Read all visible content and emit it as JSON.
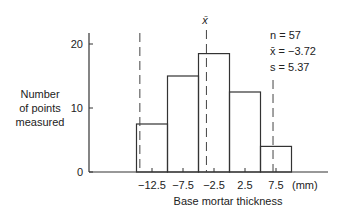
{
  "chart_data": {
    "type": "bar",
    "title": "",
    "xlabel": "Base mortar thickness",
    "x_unit": "(mm)",
    "ylabel": [
      "Number",
      "of points",
      "measured"
    ],
    "ylim": [
      0,
      22
    ],
    "y_ticks": [
      0,
      10,
      20
    ],
    "x_tick_labels": [
      "−12.5",
      "−7.5",
      "−2.5",
      "2.5",
      "7.5"
    ],
    "x_tick_values": [
      -12.5,
      -7.5,
      -2.5,
      2.5,
      7.5
    ],
    "bins": [
      [
        -15,
        -10
      ],
      [
        -10,
        -5
      ],
      [
        -5,
        0
      ],
      [
        0,
        5
      ],
      [
        5,
        10
      ]
    ],
    "categories": [
      "−12.5",
      "−7.5",
      "−2.5",
      "2.5",
      "7.5"
    ],
    "values": [
      7.5,
      15,
      18.5,
      12.5,
      4
    ],
    "reference_lines": [
      {
        "name": "lower",
        "x": -14.46,
        "style": "dashed",
        "label": ""
      },
      {
        "name": "mean",
        "x": -3.72,
        "style": "dashed",
        "label": "x̄"
      },
      {
        "name": "upper",
        "x": 7.02,
        "style": "dashed",
        "label": ""
      }
    ],
    "annotations": {
      "n": "n = 57",
      "mean": "x̄ = −3.72",
      "s": "s = 5.37"
    },
    "grid": false
  }
}
